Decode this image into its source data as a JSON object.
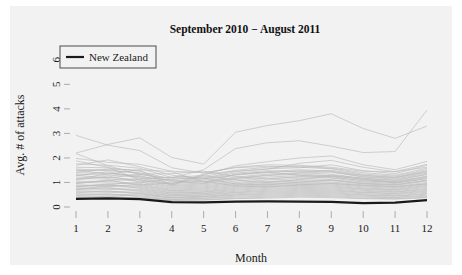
{
  "chart_data": {
    "type": "line",
    "title": "September 2010 − August 2011",
    "xlabel": "Month",
    "ylabel": "Avg. # of attacks",
    "xlim": [
      1,
      12
    ],
    "ylim": [
      0,
      6.4
    ],
    "xticks": [
      "1",
      "2",
      "3",
      "4",
      "5",
      "6",
      "7",
      "8",
      "9",
      "10",
      "11",
      "12"
    ],
    "yticks": [
      "0",
      "1",
      "2",
      "3",
      "4",
      "5",
      "6"
    ],
    "grid": false,
    "legend": {
      "position": "top-left",
      "entries": [
        "New Zealand"
      ]
    },
    "x": [
      1,
      2,
      3,
      4,
      5,
      6,
      7,
      8,
      9,
      10,
      11,
      12
    ],
    "highlight_series": {
      "name": "New Zealand",
      "color": "#1a1a1a",
      "width": 2.2,
      "values": [
        0.33,
        0.35,
        0.32,
        0.2,
        0.19,
        0.22,
        0.23,
        0.22,
        0.21,
        0.16,
        0.18,
        0.28
      ]
    },
    "background_color": "#b8b8b8",
    "background_series": [
      {
        "name": "bg-01",
        "values": [
          2.92,
          2.52,
          2.3,
          1.6,
          1.38,
          1.62,
          1.72,
          1.7,
          1.62,
          1.46,
          1.44,
          1.62
        ]
      },
      {
        "name": "bg-02",
        "values": [
          2.2,
          2.55,
          2.82,
          2.02,
          1.75,
          3.05,
          3.32,
          3.52,
          3.8,
          3.2,
          2.8,
          3.3
        ]
      },
      {
        "name": "bg-03",
        "values": [
          2.18,
          1.68,
          1.32,
          1.18,
          1.52,
          2.38,
          2.62,
          2.7,
          2.48,
          2.22,
          2.26,
          3.95
        ]
      },
      {
        "name": "bg-04",
        "values": [
          1.42,
          1.55,
          1.5,
          0.88,
          1.3,
          1.68,
          1.85,
          2.0,
          2.08,
          1.72,
          1.52,
          1.86
        ]
      },
      {
        "name": "bg-05",
        "values": [
          1.98,
          1.82,
          1.74,
          1.46,
          1.4,
          1.6,
          1.66,
          1.62,
          1.56,
          1.34,
          1.26,
          1.52
        ]
      },
      {
        "name": "bg-06",
        "values": [
          1.76,
          1.7,
          1.58,
          1.2,
          1.18,
          1.44,
          1.56,
          1.6,
          1.72,
          1.48,
          1.36,
          1.7
        ]
      },
      {
        "name": "bg-07",
        "values": [
          1.62,
          1.6,
          1.46,
          1.12,
          1.24,
          1.5,
          1.62,
          1.66,
          1.58,
          1.4,
          1.3,
          1.58
        ]
      },
      {
        "name": "bg-08",
        "values": [
          1.55,
          1.48,
          1.4,
          1.06,
          1.14,
          1.32,
          1.44,
          1.52,
          1.46,
          1.28,
          1.2,
          1.44
        ]
      },
      {
        "name": "bg-09",
        "values": [
          1.48,
          1.52,
          1.36,
          1.02,
          1.1,
          1.3,
          1.4,
          1.48,
          1.42,
          1.22,
          1.14,
          1.38
        ]
      },
      {
        "name": "bg-10",
        "values": [
          1.4,
          1.38,
          1.28,
          0.96,
          1.04,
          1.22,
          1.34,
          1.4,
          1.34,
          1.16,
          1.08,
          1.32
        ]
      },
      {
        "name": "bg-11",
        "values": [
          1.34,
          1.3,
          1.22,
          0.92,
          0.98,
          1.16,
          1.28,
          1.34,
          1.28,
          1.12,
          1.04,
          1.26
        ]
      },
      {
        "name": "bg-12",
        "values": [
          1.28,
          1.44,
          1.18,
          0.88,
          0.94,
          1.12,
          1.22,
          1.28,
          1.24,
          1.06,
          1.0,
          1.2
        ]
      },
      {
        "name": "bg-13",
        "values": [
          1.22,
          1.2,
          1.12,
          0.84,
          0.9,
          1.06,
          1.16,
          1.22,
          1.18,
          1.02,
          0.96,
          1.16
        ]
      },
      {
        "name": "bg-14",
        "values": [
          1.16,
          1.14,
          1.06,
          0.8,
          0.86,
          1.0,
          1.1,
          1.16,
          1.12,
          0.98,
          0.92,
          1.1
        ]
      },
      {
        "name": "bg-15",
        "values": [
          1.1,
          1.26,
          1.02,
          0.76,
          0.82,
          0.96,
          1.04,
          1.1,
          1.08,
          0.94,
          0.88,
          1.06
        ]
      },
      {
        "name": "bg-16",
        "values": [
          1.05,
          1.04,
          0.96,
          0.72,
          0.78,
          0.92,
          1.0,
          1.06,
          1.02,
          0.9,
          0.84,
          1.0
        ]
      },
      {
        "name": "bg-17",
        "values": [
          1.0,
          0.98,
          0.92,
          0.68,
          0.74,
          0.88,
          0.96,
          1.0,
          0.98,
          0.86,
          0.8,
          0.96
        ]
      },
      {
        "name": "bg-18",
        "values": [
          0.95,
          1.1,
          0.88,
          0.66,
          0.7,
          0.84,
          0.92,
          0.96,
          0.94,
          0.82,
          0.76,
          0.92
        ]
      },
      {
        "name": "bg-19",
        "values": [
          0.9,
          0.88,
          0.84,
          0.62,
          0.66,
          0.8,
          0.88,
          0.92,
          0.9,
          0.78,
          0.72,
          0.88
        ]
      },
      {
        "name": "bg-20",
        "values": [
          0.86,
          0.84,
          0.8,
          0.58,
          0.62,
          0.76,
          0.84,
          0.88,
          0.86,
          0.74,
          0.7,
          0.84
        ]
      },
      {
        "name": "bg-21",
        "values": [
          0.82,
          0.94,
          0.76,
          0.56,
          0.6,
          0.72,
          0.8,
          0.84,
          0.82,
          0.72,
          0.66,
          0.8
        ]
      },
      {
        "name": "bg-22",
        "values": [
          0.78,
          0.76,
          0.72,
          0.52,
          0.56,
          0.68,
          0.76,
          0.8,
          0.78,
          0.68,
          0.62,
          0.76
        ]
      },
      {
        "name": "bg-23",
        "values": [
          0.74,
          0.72,
          0.68,
          0.5,
          0.54,
          0.64,
          0.72,
          0.76,
          0.74,
          0.64,
          0.6,
          0.72
        ]
      },
      {
        "name": "bg-24",
        "values": [
          0.7,
          0.8,
          0.64,
          0.46,
          0.5,
          0.6,
          0.68,
          0.72,
          0.7,
          0.6,
          0.56,
          0.68
        ]
      },
      {
        "name": "bg-25",
        "values": [
          0.66,
          0.64,
          0.6,
          0.44,
          0.48,
          0.58,
          0.64,
          0.68,
          0.66,
          0.58,
          0.54,
          0.64
        ]
      },
      {
        "name": "bg-26",
        "values": [
          0.62,
          0.6,
          0.56,
          0.4,
          0.44,
          0.54,
          0.6,
          0.64,
          0.62,
          0.54,
          0.5,
          0.6
        ]
      },
      {
        "name": "bg-27",
        "values": [
          0.58,
          0.66,
          0.54,
          0.38,
          0.42,
          0.5,
          0.56,
          0.6,
          0.58,
          0.5,
          0.46,
          0.56
        ]
      },
      {
        "name": "bg-28",
        "values": [
          0.54,
          0.52,
          0.5,
          0.36,
          0.4,
          0.48,
          0.52,
          0.56,
          0.54,
          0.48,
          0.44,
          0.52
        ]
      },
      {
        "name": "bg-29",
        "values": [
          0.5,
          0.48,
          0.46,
          0.32,
          0.36,
          0.44,
          0.48,
          0.52,
          0.5,
          0.44,
          0.4,
          0.48
        ]
      },
      {
        "name": "bg-30",
        "values": [
          0.46,
          0.54,
          0.42,
          0.3,
          0.34,
          0.4,
          0.44,
          0.48,
          0.46,
          0.4,
          0.38,
          0.44
        ]
      },
      {
        "name": "bg-31",
        "values": [
          0.42,
          0.4,
          0.38,
          0.28,
          0.3,
          0.36,
          0.4,
          0.44,
          0.42,
          0.36,
          0.34,
          0.4
        ]
      },
      {
        "name": "bg-32",
        "values": [
          0.38,
          0.44,
          0.36,
          0.26,
          0.28,
          0.34,
          0.36,
          0.4,
          0.38,
          0.34,
          0.32,
          0.38
        ]
      },
      {
        "name": "bg-33",
        "values": [
          1.88,
          1.62,
          1.1,
          0.94,
          1.34,
          1.46,
          1.54,
          1.78,
          1.9,
          1.62,
          1.44,
          1.74
        ]
      },
      {
        "name": "bg-34",
        "values": [
          1.7,
          1.92,
          1.64,
          1.3,
          1.16,
          1.38,
          1.48,
          1.44,
          1.5,
          1.3,
          1.22,
          1.48
        ]
      },
      {
        "name": "bg-35",
        "values": [
          1.52,
          1.34,
          1.52,
          1.44,
          1.02,
          1.18,
          1.3,
          1.38,
          1.44,
          1.24,
          1.18,
          1.42
        ]
      },
      {
        "name": "bg-36",
        "values": [
          1.3,
          1.18,
          1.34,
          1.36,
          1.46,
          1.24,
          1.14,
          1.24,
          1.3,
          1.18,
          1.1,
          1.34
        ]
      },
      {
        "name": "bg-37",
        "values": [
          1.12,
          1.36,
          1.24,
          1.08,
          0.96,
          1.34,
          1.42,
          1.3,
          1.2,
          1.08,
          1.02,
          1.24
        ]
      },
      {
        "name": "bg-38",
        "values": [
          0.96,
          1.08,
          1.14,
          1.22,
          1.28,
          1.1,
          1.0,
          1.12,
          1.26,
          1.14,
          0.98,
          1.16
        ]
      },
      {
        "name": "bg-39",
        "values": [
          0.84,
          0.92,
          1.0,
          1.14,
          1.18,
          0.94,
          0.9,
          1.02,
          1.1,
          0.96,
          0.9,
          1.08
        ]
      },
      {
        "name": "bg-40",
        "values": [
          0.72,
          0.86,
          0.9,
          0.98,
          1.06,
          0.86,
          0.82,
          0.9,
          0.96,
          0.88,
          0.82,
          0.94
        ]
      }
    ]
  }
}
